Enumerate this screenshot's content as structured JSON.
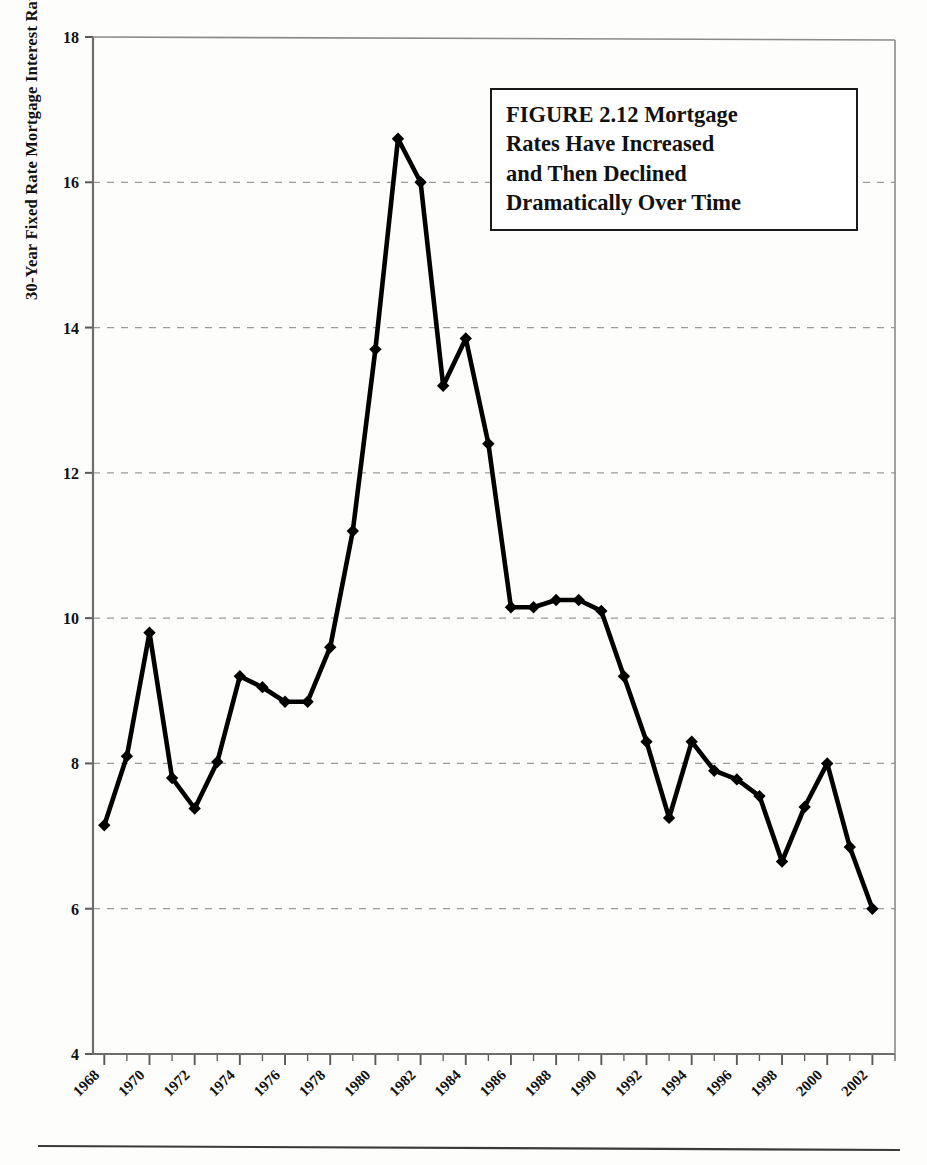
{
  "figure": {
    "title_box": {
      "lines": [
        "FIGURE 2.12  Mortgage",
        "Rates Have Increased",
        "and Then Declined",
        "Dramatically Over Time"
      ]
    },
    "y_axis_label": "30-Year Fixed Rate Mortgage Interest Rate"
  },
  "chart_data": {
    "type": "line",
    "title": "FIGURE 2.12  Mortgage Rates Have Increased and Then Declined Dramatically Over Time",
    "xlabel": "",
    "ylabel": "30-Year Fixed Rate Mortgage Interest Rate",
    "xlim": [
      1967.5,
      2003.0
    ],
    "ylim": [
      4,
      18
    ],
    "yticks": [
      4,
      6,
      8,
      10,
      12,
      14,
      16,
      18
    ],
    "ytick_labels": [
      "4",
      "6",
      "8",
      "10",
      "12",
      "14",
      "16",
      "18"
    ],
    "xticks": [
      1968,
      1970,
      1972,
      1974,
      1976,
      1978,
      1980,
      1982,
      1984,
      1986,
      1988,
      1990,
      1992,
      1994,
      1996,
      1998,
      2000,
      2002
    ],
    "xtick_labels": [
      "1968",
      "1970",
      "1972",
      "1974",
      "1976",
      "1978",
      "1980",
      "1982",
      "1984",
      "1986",
      "1988",
      "1990",
      "1992",
      "1994",
      "1996",
      "1998",
      "2000",
      "2002"
    ],
    "xtick_rotation_deg": 45,
    "minor_xtick_interval": 1,
    "grid": "horizontal-dashed",
    "legend": "none",
    "marker": "diamond",
    "line_color": "#000000",
    "x": [
      1968,
      1969,
      1970,
      1971,
      1972,
      1973,
      1974,
      1975,
      1976,
      1977,
      1978,
      1979,
      1980,
      1981,
      1982,
      1983,
      1984,
      1985,
      1986,
      1987,
      1988,
      1989,
      1990,
      1991,
      1992,
      1993,
      1994,
      1995,
      1996,
      1997,
      1998,
      1999,
      2000,
      2001,
      2002,
      2003
    ],
    "values": [
      7.15,
      8.1,
      9.8,
      7.8,
      7.38,
      8.02,
      9.2,
      9.05,
      8.85,
      8.85,
      9.6,
      11.2,
      13.7,
      16.6,
      16.0,
      13.2,
      13.85,
      12.4,
      10.15,
      10.15,
      10.25,
      10.25,
      10.1,
      9.2,
      8.3,
      7.25,
      8.3,
      7.9,
      7.78,
      7.55,
      6.65,
      7.4,
      8.0,
      6.85,
      6.0,
      null
    ],
    "series": [
      {
        "name": "30-Year Fixed Rate Mortgage Interest Rate",
        "points": [
          {
            "x": 1968,
            "y": 7.15
          },
          {
            "x": 1969,
            "y": 8.1
          },
          {
            "x": 1970,
            "y": 9.8
          },
          {
            "x": 1971,
            "y": 7.8
          },
          {
            "x": 1972,
            "y": 7.38
          },
          {
            "x": 1973,
            "y": 8.02
          },
          {
            "x": 1974,
            "y": 9.2
          },
          {
            "x": 1975,
            "y": 9.05
          },
          {
            "x": 1976,
            "y": 8.85
          },
          {
            "x": 1977,
            "y": 8.85
          },
          {
            "x": 1978,
            "y": 9.6
          },
          {
            "x": 1979,
            "y": 11.2
          },
          {
            "x": 1980,
            "y": 13.7
          },
          {
            "x": 1981,
            "y": 16.6
          },
          {
            "x": 1982,
            "y": 16.0
          },
          {
            "x": 1983,
            "y": 13.2
          },
          {
            "x": 1984,
            "y": 13.85
          },
          {
            "x": 1985,
            "y": 12.4
          },
          {
            "x": 1986,
            "y": 10.15
          },
          {
            "x": 1987,
            "y": 10.15
          },
          {
            "x": 1988,
            "y": 10.25
          },
          {
            "x": 1989,
            "y": 10.25
          },
          {
            "x": 1990,
            "y": 10.1
          },
          {
            "x": 1991,
            "y": 9.2
          },
          {
            "x": 1992,
            "y": 8.3
          },
          {
            "x": 1993,
            "y": 7.25
          },
          {
            "x": 1994,
            "y": 8.3
          },
          {
            "x": 1995,
            "y": 7.9
          },
          {
            "x": 1996,
            "y": 7.78
          },
          {
            "x": 1997,
            "y": 7.55
          },
          {
            "x": 1998,
            "y": 6.65
          },
          {
            "x": 1999,
            "y": 7.4
          },
          {
            "x": 2000,
            "y": 8.0
          },
          {
            "x": 2001,
            "y": 6.85
          },
          {
            "x": 2002,
            "y": 6.0
          }
        ]
      }
    ]
  }
}
